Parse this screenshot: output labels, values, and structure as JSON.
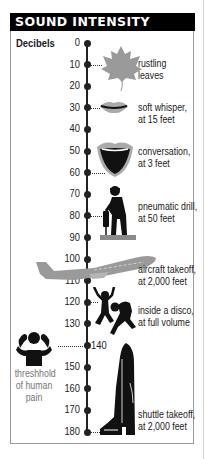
{
  "title": "SOUND INTENSITY",
  "colors": {
    "header_bg": "#000000",
    "header_text": "#ffffff",
    "axis": "#222222",
    "icon_dark": "#111111",
    "icon_gray": "#9a9a9a"
  },
  "chart_data": {
    "type": "infographic-scale",
    "title": "SOUND INTENSITY",
    "ylabel": "Decibels",
    "ylim": [
      0,
      180
    ],
    "ticks": [
      0,
      10,
      20,
      30,
      40,
      50,
      60,
      70,
      80,
      90,
      100,
      110,
      120,
      130,
      140,
      150,
      160,
      170,
      180
    ],
    "tick_labels": [
      "0",
      "10",
      "20",
      "30",
      "40",
      "50",
      "60",
      "70",
      "80",
      "90",
      "100",
      "110",
      "120",
      "130",
      "140",
      "150",
      "160",
      "170",
      "180"
    ],
    "annotations": [
      {
        "db": 10,
        "label": "rustling leaves",
        "icon": "leaf-icon"
      },
      {
        "db": 30,
        "label": "soft whisper, at 15 feet",
        "icon": "closed-lips-icon"
      },
      {
        "db": 60,
        "label": "conversation, at 3 feet",
        "icon": "open-mouth-icon"
      },
      {
        "db": 80,
        "label": "pneumatic drill, at 50 feet",
        "icon": "jackhammer-worker-icon"
      },
      {
        "db": 100,
        "label": "aircraft takeoff, at 2,000 feet",
        "icon": "airplane-icon"
      },
      {
        "db": 120,
        "label": "inside a disco, at full volume",
        "icon": "dancers-icon"
      },
      {
        "db": 140,
        "label": "threshhold of human pain",
        "icon": "covering-ears-icon"
      },
      {
        "db": 180,
        "label": "shuttle takeoff, at 2,000 feet",
        "icon": "space-shuttle-icon"
      }
    ]
  },
  "labels": {
    "leaves": [
      "rustling",
      "leaves"
    ],
    "whisper": [
      "soft whisper,",
      "at 15 feet"
    ],
    "conversation": [
      "conversation,",
      "at 3 feet"
    ],
    "drill": [
      "pneumatic drill,",
      "at 50 feet"
    ],
    "aircraft": [
      "aircraft takeoff,",
      "at 2,000 feet"
    ],
    "disco": [
      "inside a disco,",
      "at full volume"
    ],
    "pain": [
      "threshhold",
      "of human",
      "pain"
    ],
    "shuttle": [
      "shuttle takeoff,",
      "at 2,000 feet"
    ]
  }
}
